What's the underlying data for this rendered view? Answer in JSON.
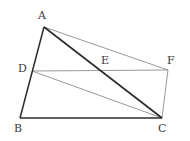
{
  "figure": {
    "name": "quadrilateral-geometry-diagram",
    "background_color": "#ffffff",
    "width": 190,
    "height": 141,
    "stroke_dark": "#2b2b2b",
    "stroke_light": "#8d8d8d",
    "label_color": "#3a3a3a",
    "points": {
      "A": {
        "label": "A",
        "x": 44,
        "y": 27,
        "label_x": 38,
        "label_y": 10
      },
      "B": {
        "label": "B",
        "x": 20,
        "y": 118,
        "label_x": 14,
        "label_y": 123
      },
      "C": {
        "label": "C",
        "x": 162,
        "y": 118,
        "label_x": 158,
        "label_y": 123
      },
      "D": {
        "label": "D",
        "x": 32,
        "y": 71,
        "label_x": 18,
        "label_y": 63
      },
      "E": {
        "label": "E",
        "x": 105,
        "y": 71,
        "label_x": 101,
        "label_y": 55
      },
      "F": {
        "label": "F",
        "x": 168,
        "y": 70,
        "label_x": 167,
        "label_y": 55
      }
    },
    "segments": [
      {
        "name": "segment-AB",
        "from": "A",
        "to": "B",
        "weight": "dark",
        "width": 1.5
      },
      {
        "name": "segment-BC",
        "from": "B",
        "to": "C",
        "weight": "dark",
        "width": 1.5
      },
      {
        "name": "segment-AC",
        "from": "A",
        "to": "C",
        "weight": "dark",
        "width": 1.6
      },
      {
        "name": "segment-AF",
        "from": "A",
        "to": "F",
        "weight": "light",
        "width": 0.9
      },
      {
        "name": "segment-DF",
        "from": "D",
        "to": "F",
        "weight": "light",
        "width": 0.9
      },
      {
        "name": "segment-DC",
        "from": "D",
        "to": "C",
        "weight": "light",
        "width": 0.9
      },
      {
        "name": "segment-FC",
        "from": "F",
        "to": "C",
        "weight": "light",
        "width": 0.9
      }
    ]
  }
}
